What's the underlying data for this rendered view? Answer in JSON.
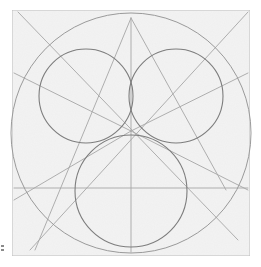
{
  "image": {
    "description": "Pencil geometric construction drawing on textured paper: a large circle inscribed in a square, with three overlapping smaller circles meeting at the center, plus construction lines (triangle, diagonals, vertical and horizontal guides).",
    "paper": {
      "x": 12,
      "y": 10,
      "width": 238,
      "height": 246,
      "color": "#f3f3f3",
      "border_color": "#bdbdbd"
    },
    "pencil_color": "#9a9a9a",
    "pencil_dark": "#7d7d7d",
    "big_circle": {
      "cx": 131,
      "cy": 133,
      "r": 120
    },
    "small_circles": [
      {
        "name": "top-left",
        "cx": 86,
        "cy": 96,
        "r": 47
      },
      {
        "name": "top-right",
        "cx": 176,
        "cy": 96,
        "r": 47
      },
      {
        "name": "bottom",
        "cx": 131,
        "cy": 191,
        "r": 56
      }
    ],
    "center_point": {
      "x": 131,
      "y": 131
    },
    "lines": [
      {
        "name": "vertical-axis",
        "x1": 131,
        "y1": 18,
        "x2": 131,
        "y2": 252
      },
      {
        "name": "horizontal-guide",
        "x1": 14,
        "y1": 188,
        "x2": 248,
        "y2": 188
      },
      {
        "name": "triangle-left",
        "x1": 131,
        "y1": 18,
        "x2": 35,
        "y2": 250
      },
      {
        "name": "triangle-right",
        "x1": 131,
        "y1": 18,
        "x2": 226,
        "y2": 190
      },
      {
        "name": "diagonal-tl-br",
        "x1": 18,
        "y1": 12,
        "x2": 238,
        "y2": 240
      },
      {
        "name": "diagonal-tr-bl",
        "x1": 248,
        "y1": 12,
        "x2": 30,
        "y2": 250
      },
      {
        "name": "ray-left-upper",
        "x1": 14,
        "y1": 73,
        "x2": 131,
        "y2": 131
      },
      {
        "name": "ray-right-upper",
        "x1": 248,
        "y1": 73,
        "x2": 131,
        "y2": 131
      },
      {
        "name": "ray-left-lower",
        "x1": 14,
        "y1": 200,
        "x2": 131,
        "y2": 131
      },
      {
        "name": "ray-right-lower",
        "x1": 248,
        "y1": 190,
        "x2": 131,
        "y2": 131
      }
    ]
  }
}
